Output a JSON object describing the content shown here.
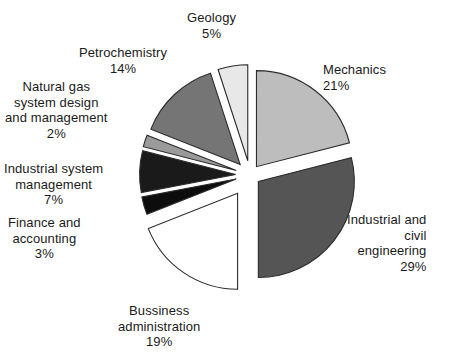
{
  "chart_data": {
    "type": "pie",
    "title": "",
    "subtitle": "",
    "xlabel": "",
    "ylabel": "",
    "legend_position": "none",
    "grid": false,
    "value_unit": "%",
    "labels_show_percent": true,
    "exploded": true,
    "total": 100,
    "categories": [
      "Mechanics",
      "Industrial and civil engineering",
      "Bussiness administration",
      "Finance and accounting",
      "Industrial system management",
      "Natural gas system design and management",
      "Petrochemistry",
      "Geology"
    ],
    "values": [
      21,
      29,
      19,
      3,
      7,
      2,
      14,
      5
    ],
    "colors": [
      "#bdbdbd",
      "#555555",
      "#ffffff",
      "#0d0d0d",
      "#1a1a1a",
      "#9a9a9a",
      "#757575",
      "#e8e8e8"
    ],
    "slice_outline_color": "#2b2b2b",
    "background_color": "#ffffff",
    "slices": [
      {
        "name": "Mechanics",
        "value": 21,
        "percent_label": "21%",
        "color": "#bdbdbd",
        "start_angle": 0,
        "end_angle": 75.6,
        "explode": 0.055,
        "label_lines": [
          "Mechanics"
        ],
        "label_align": "left",
        "label_x": 323,
        "label_y": 62
      },
      {
        "name": "Industrial and civil engineering",
        "value": 29,
        "percent_label": "29%",
        "color": "#555555",
        "start_angle": 75.6,
        "end_angle": 180.0,
        "explode": 0.055,
        "label_lines": [
          "Industrial and",
          "civil",
          "engineering"
        ],
        "label_align": "right",
        "label_x": 347,
        "label_y": 212
      },
      {
        "name": "Bussiness administration",
        "value": 19,
        "percent_label": "19%",
        "color": "#ffffff",
        "start_angle": 180.0,
        "end_angle": 248.4,
        "explode": 0.115,
        "label_lines": [
          "Bussiness",
          "administration"
        ],
        "label_align": "center",
        "label_x": 118,
        "label_y": 303
      },
      {
        "name": "Finance and accounting",
        "value": 3,
        "percent_label": "3%",
        "color": "#0d0d0d",
        "start_angle": 248.4,
        "end_angle": 259.2,
        "explode": 0.075,
        "label_lines": [
          "Finance and",
          "accounting"
        ],
        "label_align": "center",
        "label_x": 8,
        "label_y": 215
      },
      {
        "name": "Industrial system management",
        "value": 7,
        "percent_label": "7%",
        "color": "#1a1a1a",
        "start_angle": 259.2,
        "end_angle": 284.4,
        "explode": 0.075,
        "label_lines": [
          "Industrial system",
          "management"
        ],
        "label_align": "center",
        "label_x": 4,
        "label_y": 161
      },
      {
        "name": "Natural gas system design and management",
        "value": 2,
        "percent_label": "2%",
        "color": "#9a9a9a",
        "start_angle": 284.4,
        "end_angle": 291.6,
        "explode": 0.075,
        "label_lines": [
          "Natural gas",
          "system design",
          "and management"
        ],
        "label_align": "center",
        "label_x": 5,
        "label_y": 79
      },
      {
        "name": "Petrochemistry",
        "value": 14,
        "percent_label": "14%",
        "color": "#757575",
        "start_angle": 291.6,
        "end_angle": 342.0,
        "explode": 0.075,
        "label_lines": [
          "Petrochemistry"
        ],
        "label_align": "center",
        "label_x": 79,
        "label_y": 45
      },
      {
        "name": "Geology",
        "value": 5,
        "percent_label": "5%",
        "color": "#e8e8e8",
        "start_angle": 342.0,
        "end_angle": 360.0,
        "explode": 0.075,
        "label_lines": [
          "Geology"
        ],
        "label_align": "center",
        "label_x": 187,
        "label_y": 10
      }
    ],
    "geometry": {
      "center_x": 250,
      "center_y": 175,
      "radius": 96
    }
  }
}
